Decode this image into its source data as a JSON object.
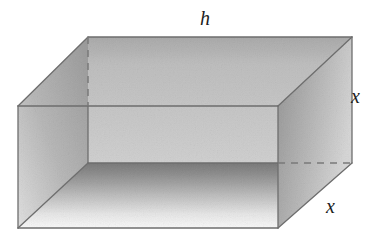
{
  "figure": {
    "type": "geometry-diagram",
    "projection": "oblique",
    "background_color": "#ffffff",
    "outline_color": "#6b6b6b",
    "label_color": "#1d1d1d",
    "labels": [
      {
        "id": "h",
        "text": "h",
        "edge": "back-top-horizontal",
        "x": 208,
        "y": 20
      },
      {
        "id": "x-right",
        "text": "x",
        "edge": "right-vertical-height",
        "x": 358,
        "y": 95
      },
      {
        "id": "x-front",
        "text": "x",
        "edge": "right-depth",
        "x": 333,
        "y": 205
      }
    ],
    "vertices": {
      "back_top_left": [
        88,
        37
      ],
      "back_top_right": [
        352,
        37
      ],
      "front_top_left": [
        18,
        106
      ],
      "front_top_right": [
        278,
        106
      ],
      "back_bottom_left": [
        88,
        163
      ],
      "back_bottom_right": [
        352,
        163
      ],
      "front_bottom_left": [
        18,
        228
      ],
      "front_bottom_right": [
        278,
        228
      ]
    },
    "faces": [
      {
        "id": "back-face",
        "name": "back-panel",
        "fill_from": "#d2d2d2",
        "fill_to": "#e4e4e4"
      },
      {
        "id": "left-face",
        "name": "left-panel",
        "fill_from": "#cfcfcf",
        "fill_to": "#ededed"
      },
      {
        "id": "right-face",
        "name": "right-panel",
        "fill_from": "#c9c9c9",
        "fill_to": "#e8e8e8"
      },
      {
        "id": "floor-face",
        "name": "bottom-panel",
        "fill_from": "#b6b6b6",
        "fill_to": "#fbfbfb"
      }
    ],
    "hidden_edges": [
      {
        "id": "back-left-vertical",
        "from": [
          88,
          37
        ],
        "to": [
          88,
          106
        ]
      },
      {
        "id": "back-right-depth",
        "from": [
          278,
          163
        ],
        "to": [
          352,
          163
        ]
      }
    ]
  }
}
